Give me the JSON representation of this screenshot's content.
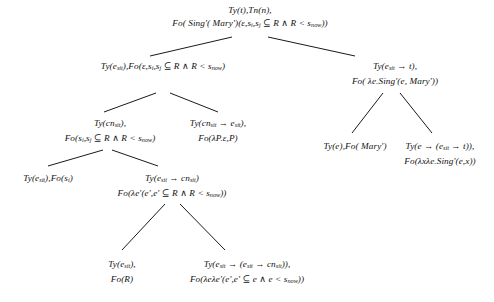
{
  "diagram": {
    "node_font_style": "italic-serif",
    "background_color": "#ffffff",
    "edge_color": "#1a1a1a",
    "nodes": [
      {
        "id": "root",
        "name": "root-node",
        "x": 250,
        "y": 4,
        "lines": [
          "Ty(t),Tn(n),",
          "Fo( Sing'( Mary')(ε,sᵢ,sⱼ ⊆ R ∧ R < sₙₒᵥᵥ))"
        ],
        "lines_html": [
          "Ty(t),Tn(n),",
          "Fo( Sing'( Mary')(ε,s<sub>i</sub>,s<sub>j</sub> ⊆ R ∧ R < s<sub>now</sub>))"
        ]
      },
      {
        "id": "left-1",
        "name": "node-ty-esit-fo-epsilon",
        "x": 163,
        "y": 60,
        "lines": [
          "Ty(eₛᵢₜ),Fo(ε,sᵢ,sⱼ ⊆ R ∧ R < sₙₒᵥᵥ)"
        ],
        "lines_html": [
          "Ty(e<sub>sit</sub>),Fo(ε,s<sub>i</sub>,s<sub>j</sub> ⊆ R ∧ R < s<sub>now</sub>)"
        ]
      },
      {
        "id": "right-1",
        "name": "node-ty-esit-arrow-t",
        "x": 395,
        "y": 60,
        "lines": [
          "Ty(eₛᵢₜ → t),",
          "Fo( λe.Sing'(e, Mary'))"
        ],
        "lines_html": [
          "Ty(e<sub>sit</sub> → t),",
          "Fo( λe.Sing'(e, Mary'))"
        ]
      },
      {
        "id": "left-2a",
        "name": "node-ty-cnsit",
        "x": 110,
        "y": 117,
        "lines": [
          "Ty(cnₛᵢₜ),",
          "Fo(sᵢ,sⱼ ⊆ R ∧ R < sₙₒᵥᵥ)"
        ],
        "lines_html": [
          "Ty(cn<sub>sit</sub>),",
          "Fo(s<sub>i</sub>,s<sub>j</sub> ⊆ R ∧ R < s<sub>now</sub>)"
        ]
      },
      {
        "id": "left-2b",
        "name": "node-ty-cnsit-arrow-esit",
        "x": 218,
        "y": 117,
        "lines": [
          "Ty(cnₛᵢₜ → eₛᵢₜ),",
          "Fo(λP.ε,P)"
        ],
        "lines_html": [
          "Ty(cn<sub>sit</sub> → e<sub>sit</sub>),",
          "Fo(λP.ε,P)"
        ]
      },
      {
        "id": "right-2a",
        "name": "node-ty-e-fo-mary",
        "x": 355,
        "y": 140,
        "lines": [
          "Ty(e),Fo( Mary')"
        ],
        "lines_html": [
          "Ty(e),Fo( Mary')"
        ]
      },
      {
        "id": "right-2b",
        "name": "node-ty-e-arrow-esit-arrow-t",
        "x": 440,
        "y": 140,
        "lines": [
          "Ty(e → (eₛᵢₜ → t)),",
          "Fo(λxλe.Sing'(e,x))"
        ],
        "lines_html": [
          "Ty(e → (e<sub>sit</sub> → t)),",
          "Fo(λxλe.Sing'(e,x))"
        ]
      },
      {
        "id": "left-3a",
        "name": "node-ty-esit-fo-si",
        "x": 48,
        "y": 172,
        "lines": [
          "Ty(eₛᵢₜ),Fo(sᵢ)"
        ],
        "lines_html": [
          "Ty(e<sub>sit</sub>),Fo(s<sub>i</sub>)"
        ]
      },
      {
        "id": "left-3b",
        "name": "node-ty-esit-arrow-cnsit",
        "x": 172,
        "y": 172,
        "lines": [
          "Ty(eₛᵢₜ → cnₛᵢₜ)",
          "Fo(λe'(e',e' ⊆ R ∧ R < sₙₒᵥᵥ))"
        ],
        "lines_html": [
          "Ty(e<sub>sit</sub> → cn<sub>sit</sub>)",
          "Fo(λe'(e',e' ⊆ R ∧ R < s<sub>now</sub>))"
        ]
      },
      {
        "id": "bottom-a",
        "name": "node-ty-esit-fo-r",
        "x": 122,
        "y": 258,
        "lines": [
          "Ty(eₛᵢₜ),",
          "Fo(R)"
        ],
        "lines_html": [
          "Ty(e<sub>sit</sub>),",
          "Fo(R)"
        ]
      },
      {
        "id": "bottom-b",
        "name": "node-ty-esit-arrow-esit-arrow-cnsit",
        "x": 247,
        "y": 258,
        "lines": [
          "Ty(eₛᵢₜ → (eₛᵢₜ → cnₛᵢₜ)),",
          "Fo(λeλe'(e',e' ⊆ e ∧ e < sₙₒᵥᵥ))"
        ],
        "lines_html": [
          "Ty(e<sub>sit</sub> → (e<sub>sit</sub> → cn<sub>sit</sub>)),",
          "Fo(λeλe'(e',e' ⊆ e ∧ e < s<sub>now</sub>))"
        ]
      }
    ],
    "edges": [
      {
        "name": "edge-root-to-left1",
        "x1": 232,
        "y1": 37,
        "x2": 150,
        "y2": 56
      },
      {
        "name": "edge-root-to-right1",
        "x1": 268,
        "y1": 37,
        "x2": 355,
        "y2": 56
      },
      {
        "name": "edge-left1-to-cnsit",
        "x1": 156,
        "y1": 93,
        "x2": 104,
        "y2": 112
      },
      {
        "name": "edge-left1-to-cnsit-e",
        "x1": 170,
        "y1": 93,
        "x2": 218,
        "y2": 112
      },
      {
        "name": "edge-right1-to-e",
        "x1": 383,
        "y1": 93,
        "x2": 352,
        "y2": 133
      },
      {
        "name": "edge-right1-to-ee",
        "x1": 400,
        "y1": 93,
        "x2": 432,
        "y2": 133
      },
      {
        "name": "edge-cnsit-to-si",
        "x1": 103,
        "y1": 150,
        "x2": 48,
        "y2": 166
      },
      {
        "name": "edge-cnsit-to-cn",
        "x1": 112,
        "y1": 150,
        "x2": 158,
        "y2": 166
      },
      {
        "name": "edge-cn-to-r",
        "x1": 165,
        "y1": 204,
        "x2": 122,
        "y2": 250
      },
      {
        "name": "edge-cn-to-ee",
        "x1": 180,
        "y1": 204,
        "x2": 225,
        "y2": 250
      }
    ]
  }
}
